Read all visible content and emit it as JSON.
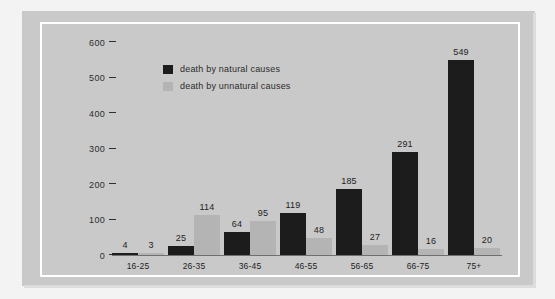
{
  "chart_data": {
    "type": "bar",
    "title": "",
    "subtitle": "",
    "xlabel": "",
    "ylabel": "",
    "categories": [
      "16-25",
      "26-35",
      "36-45",
      "46-55",
      "56-65",
      "66-75",
      "75+"
    ],
    "series": [
      {
        "name": "death by natural causes",
        "color": "#1c1c1c",
        "values": [
          4,
          25,
          64,
          119,
          185,
          291,
          549
        ]
      },
      {
        "name": "death by unnatural causes",
        "color": "#b4b4b4",
        "values": [
          3,
          114,
          95,
          48,
          27,
          16,
          20
        ]
      }
    ],
    "ylim": [
      0,
      600
    ],
    "yticks": [
      "0",
      "100",
      "200",
      "300",
      "400",
      "500",
      "600"
    ],
    "grid": false,
    "legend_position": "top-left",
    "data_labels": true
  },
  "legend": {
    "items": [
      {
        "label": "death by natural causes",
        "icon": "legend-swatch-dark"
      },
      {
        "label": "death by unnatural causes",
        "icon": "legend-swatch-light"
      }
    ]
  },
  "colors": {
    "background": "#c9c9c9",
    "frame": "#ffffff",
    "page": "#f3f3f3",
    "natural": "#1c1c1c",
    "unnatural": "#b4b4b4",
    "text": "#232323",
    "axis": "#5a5a5a"
  }
}
